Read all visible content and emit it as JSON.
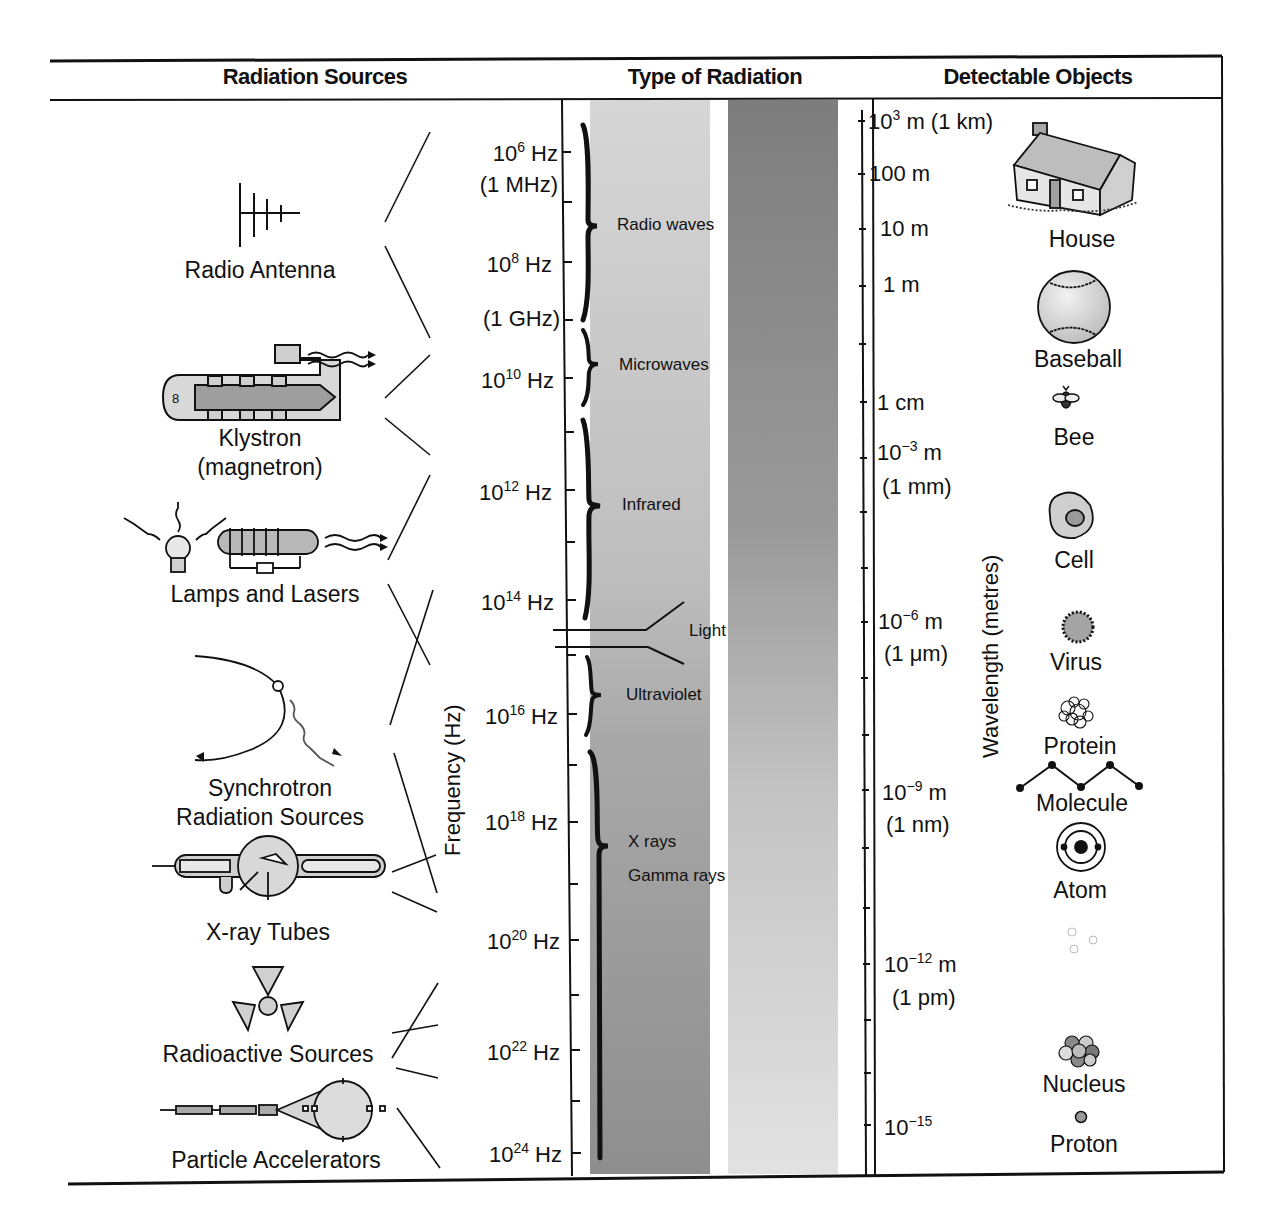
{
  "headers": {
    "sources": "Radiation Sources",
    "type": "Type of Radiation",
    "objects": "Detectable Objects"
  },
  "axes": {
    "frequency_title": "Frequency (Hz)",
    "wavelength_title": "Wavelength (metres)"
  },
  "sources": [
    {
      "label": "Radio Antenna",
      "icon": "radio-antenna-icon"
    },
    {
      "label": "Klystron",
      "label2": "(magnetron)",
      "icon": "klystron-icon"
    },
    {
      "label": "Lamps and Lasers",
      "icon": "lamp-laser-icon"
    },
    {
      "label": "Synchrotron",
      "label2": "Radiation Sources",
      "icon": "synchrotron-icon"
    },
    {
      "label": "X-ray Tubes",
      "icon": "xray-tube-icon"
    },
    {
      "label": "Radioactive Sources",
      "icon": "radioactive-icon"
    },
    {
      "label": "Particle Accelerators",
      "icon": "particle-accelerator-icon"
    }
  ],
  "frequency_ticks": [
    {
      "base": "10",
      "exp": "6",
      "unit": " Hz",
      "note": "(1 MHz)"
    },
    {
      "base": "10",
      "exp": "8",
      "unit": " Hz",
      "note": "(1 GHz)"
    },
    {
      "base": "10",
      "exp": "10",
      "unit": " Hz"
    },
    {
      "base": "10",
      "exp": "12",
      "unit": " Hz"
    },
    {
      "base": "10",
      "exp": "14",
      "unit": " Hz"
    },
    {
      "base": "10",
      "exp": "16",
      "unit": " Hz"
    },
    {
      "base": "10",
      "exp": "18",
      "unit": " Hz"
    },
    {
      "base": "10",
      "exp": "20",
      "unit": " Hz"
    },
    {
      "base": "10",
      "exp": "22",
      "unit": " Hz"
    },
    {
      "base": "10",
      "exp": "24",
      "unit": " Hz"
    }
  ],
  "radiation_types": [
    {
      "label": "Radio waves"
    },
    {
      "label": "Microwaves"
    },
    {
      "label": "Infrared"
    },
    {
      "label": "Light"
    },
    {
      "label": "Ultraviolet"
    },
    {
      "label": "X rays"
    },
    {
      "label": "Gamma rays"
    }
  ],
  "wavelength_ticks": [
    {
      "base": "10",
      "exp": "3",
      "unit": " m",
      "note": " (1 km)"
    },
    {
      "text": "100 m"
    },
    {
      "text": "10 m"
    },
    {
      "text": "1 m"
    },
    {
      "text": "1 cm"
    },
    {
      "base": "10",
      "exp": "−3",
      "unit": " m",
      "note": "(1 mm)"
    },
    {
      "base": "10",
      "exp": "−6",
      "unit": " m",
      "note": "(1 μm)"
    },
    {
      "base": "10",
      "exp": "−9",
      "unit": " m",
      "note": "(1 nm)"
    },
    {
      "base": "10",
      "exp": "−12",
      "unit": " m",
      "note": "(1 pm)"
    },
    {
      "base": "10",
      "exp": "−15",
      "unit": ""
    }
  ],
  "objects": [
    {
      "label": "House",
      "icon": "house-icon"
    },
    {
      "label": "Baseball",
      "icon": "baseball-icon"
    },
    {
      "label": "Bee",
      "icon": "bee-icon"
    },
    {
      "label": "Cell",
      "icon": "cell-icon"
    },
    {
      "label": "Virus",
      "icon": "virus-icon"
    },
    {
      "label": "Protein",
      "icon": "protein-icon"
    },
    {
      "label": "Molecule",
      "icon": "molecule-icon"
    },
    {
      "label": "Atom",
      "icon": "atom-icon"
    },
    {
      "label": "Nucleus",
      "icon": "nucleus-icon"
    },
    {
      "label": "Proton",
      "icon": "proton-icon"
    }
  ],
  "colors": {
    "ink": "#111111",
    "band_light": "#d2d2d2",
    "band_dark": "#8a8a8a",
    "fill_gray": "#c8c8c8"
  }
}
